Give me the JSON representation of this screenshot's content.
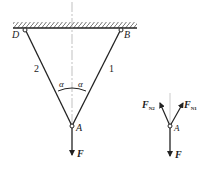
{
  "diagram": {
    "structure": {
      "points": {
        "D": {
          "label": "D"
        },
        "B": {
          "label": "B"
        },
        "A": {
          "label": "A"
        }
      },
      "bars": [
        {
          "id": "bar-2",
          "label": "2"
        },
        {
          "id": "bar-1",
          "label": "1"
        }
      ],
      "angles": [
        {
          "label": "α"
        },
        {
          "label": "α"
        }
      ],
      "load": {
        "label": "F"
      }
    },
    "free_body": {
      "point": {
        "label": "A"
      },
      "forces": [
        {
          "label": "F",
          "sub": "N2"
        },
        {
          "label": "F",
          "sub": "N1"
        },
        {
          "label": "F",
          "sub": ""
        }
      ]
    },
    "colors": {
      "line": "#222222",
      "centerline": "#888888"
    }
  }
}
